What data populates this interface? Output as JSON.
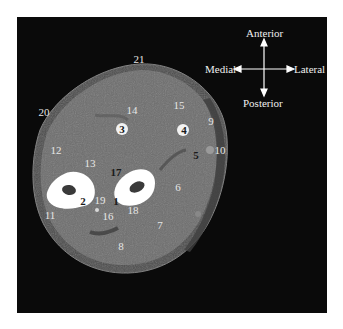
{
  "figure": {
    "orientation": {
      "anterior": "Anterior",
      "posterior": "Posterior",
      "medial": "Medial",
      "lateral": "Lateral"
    },
    "labels": [
      {
        "id": "1",
        "text": "1",
        "x": 116,
        "y": 201,
        "dark": true
      },
      {
        "id": "2",
        "text": "2",
        "x": 83,
        "y": 201,
        "dark": true
      },
      {
        "id": "3",
        "text": "3",
        "x": 122,
        "y": 129,
        "dark": true
      },
      {
        "id": "4",
        "text": "4",
        "x": 184,
        "y": 130,
        "dark": true
      },
      {
        "id": "5",
        "text": "5",
        "x": 196,
        "y": 155,
        "dark": true
      },
      {
        "id": "6",
        "text": "6",
        "x": 178,
        "y": 187,
        "dark": false
      },
      {
        "id": "7",
        "text": "7",
        "x": 160,
        "y": 225,
        "dark": false
      },
      {
        "id": "8",
        "text": "8",
        "x": 121,
        "y": 246,
        "dark": false
      },
      {
        "id": "9",
        "text": "9",
        "x": 211,
        "y": 121,
        "dark": false
      },
      {
        "id": "10",
        "text": "10",
        "x": 220,
        "y": 150,
        "dark": false
      },
      {
        "id": "11",
        "text": "11",
        "x": 50,
        "y": 215,
        "dark": false
      },
      {
        "id": "12",
        "text": "12",
        "x": 56,
        "y": 150,
        "dark": false
      },
      {
        "id": "13",
        "text": "13",
        "x": 90,
        "y": 163,
        "dark": false
      },
      {
        "id": "14",
        "text": "14",
        "x": 132,
        "y": 110,
        "dark": false
      },
      {
        "id": "15",
        "text": "15",
        "x": 179,
        "y": 105,
        "dark": false
      },
      {
        "id": "16",
        "text": "16",
        "x": 108,
        "y": 216,
        "dark": false
      },
      {
        "id": "17",
        "text": "17",
        "x": 116,
        "y": 172,
        "dark": true
      },
      {
        "id": "18",
        "text": "18",
        "x": 133,
        "y": 210,
        "dark": false
      },
      {
        "id": "19",
        "text": "19",
        "x": 100,
        "y": 200,
        "dark": false
      },
      {
        "id": "20",
        "text": "20",
        "x": 44,
        "y": 112,
        "dark": false
      },
      {
        "id": "21",
        "text": "21",
        "x": 139,
        "y": 59,
        "dark": false
      }
    ]
  }
}
